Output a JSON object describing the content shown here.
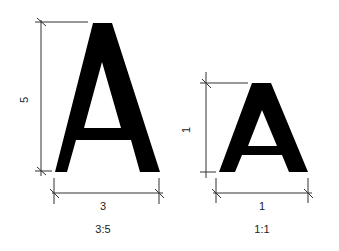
{
  "diagram": {
    "left_figure": {
      "letter": "A",
      "height_label": "5",
      "width_label": "3",
      "ratio_label": "3:5"
    },
    "right_figure": {
      "letter": "A",
      "height_label": "1",
      "width_label": "1",
      "ratio_label": "1:1"
    },
    "colors": {
      "glyph": "#000000",
      "dimension_line": "#333333",
      "background": "#ffffff"
    }
  }
}
